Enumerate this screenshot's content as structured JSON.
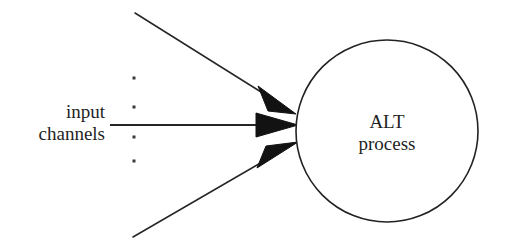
{
  "figure": {
    "background_color": "#ffffff",
    "stroke_color": "#222222",
    "text_color": "#1f1f1f"
  },
  "node": {
    "shape": "circle",
    "label_line1": "ALT",
    "label_line2": "process",
    "center_x": 387,
    "center_y": 131,
    "radius": 91,
    "fill": "#ffffff",
    "stroke": "#222222"
  },
  "input_label": {
    "line1": "input",
    "line2": "channels"
  },
  "ellipsis": {
    "glyph": "·",
    "count": 4,
    "x": 134,
    "ys": [
      78,
      107,
      137,
      161
    ]
  },
  "channels": [
    {
      "id": "channel-top",
      "type": "diagonal-down-right",
      "start_x": 135,
      "start_y": 13,
      "tip_x": 296,
      "tip_y": 114
    },
    {
      "id": "channel-middle",
      "type": "horizontal",
      "start_x": 110,
      "start_y": 125,
      "tip_x": 298,
      "tip_y": 125
    },
    {
      "id": "channel-bottom",
      "type": "diagonal-up-right",
      "start_x": 133,
      "start_y": 237,
      "tip_x": 298,
      "tip_y": 142
    }
  ]
}
